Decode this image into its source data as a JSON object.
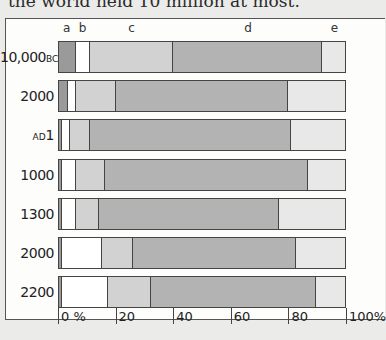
{
  "caption": "the world held 10 million at most.",
  "chart_data": {
    "type": "bar",
    "orientation": "horizontal",
    "stacked": true,
    "title": "",
    "xlabel": "%",
    "ylabel": "",
    "xlim": [
      0,
      100
    ],
    "x_ticks": [
      "0 %",
      "20",
      "40",
      "60",
      "80",
      "100%"
    ],
    "categories": [
      "10,000 BC",
      "2000 BC",
      "AD 1",
      "1000",
      "1300",
      "2000",
      "2200"
    ],
    "series": [
      {
        "name": "a",
        "color": "#9a9a9a",
        "values": [
          6,
          3,
          1,
          1,
          1,
          1,
          1
        ]
      },
      {
        "name": "b",
        "color": "#ffffff",
        "values": [
          5,
          3,
          3,
          5,
          5,
          14,
          16
        ]
      },
      {
        "name": "c",
        "color": "#d2d2d2",
        "values": [
          29,
          14,
          7,
          10,
          8,
          11,
          15
        ]
      },
      {
        "name": "d",
        "color": "#b3b3b3",
        "values": [
          52,
          60,
          70,
          71,
          63,
          57,
          58
        ]
      },
      {
        "name": "e",
        "color": "#e8e8e8",
        "values": [
          8,
          20,
          19,
          13,
          23,
          17,
          10
        ]
      }
    ],
    "legend_position": "top (letters above columns)",
    "grid": false
  },
  "rows": [
    {
      "label": "10,000",
      "suffix": "BC"
    },
    {
      "label": "2000",
      "suffix": ""
    },
    {
      "label": "1",
      "prefix": "AD"
    },
    {
      "label": "1000",
      "suffix": ""
    },
    {
      "label": "1300",
      "suffix": ""
    },
    {
      "label": "2000",
      "suffix": ""
    },
    {
      "label": "2200",
      "suffix": ""
    }
  ],
  "column_labels": [
    "a",
    "b",
    "c",
    "d",
    "e"
  ]
}
